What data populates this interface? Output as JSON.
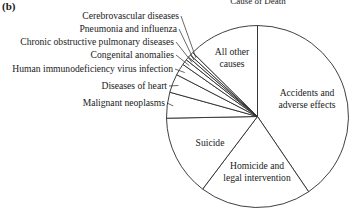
{
  "panel_label": "(b)",
  "chart_data": {
    "type": "pie",
    "title": "Cause of Death",
    "start_angle_deg": 90,
    "direction": "clockwise",
    "slices": [
      {
        "label": "Accidents and adverse effects",
        "lines": [
          "Accidents and",
          "adverse effects"
        ],
        "percent": 40.5,
        "label_inside": true
      },
      {
        "label": "Homicide and legal intervention",
        "lines": [
          "Homicide and",
          "legal intervention"
        ],
        "percent": 19.8,
        "label_inside": true
      },
      {
        "label": "Suicide",
        "lines": [
          "Suicide"
        ],
        "percent": 14.4,
        "label_inside": true
      },
      {
        "label": "Malignant neoplasms",
        "lines": [
          "Malignant neoplasms"
        ],
        "percent": 4.6,
        "label_inside": false
      },
      {
        "label": "Diseases of heart",
        "lines": [
          "Diseases of heart"
        ],
        "percent": 3.3,
        "label_inside": false
      },
      {
        "label": "Human immunodeficiency virus infection",
        "lines": [
          "Human immunodeficiency virus infection"
        ],
        "percent": 2.1,
        "label_inside": false
      },
      {
        "label": "Congenital anomalies",
        "lines": [
          "Congenital anomalies"
        ],
        "percent": 1.0,
        "label_inside": false
      },
      {
        "label": "Chronic obstructive pulmonary diseases",
        "lines": [
          "Chronic obstructive pulmonary diseases"
        ],
        "percent": 0.6,
        "label_inside": false
      },
      {
        "label": "Pneumonia and influenza",
        "lines": [
          "Pneumonia and influenza"
        ],
        "percent": 0.5,
        "label_inside": false
      },
      {
        "label": "Cerebrovascular diseases",
        "lines": [
          "Cerebrovascular diseases"
        ],
        "percent": 0.6,
        "label_inside": false
      },
      {
        "label": "All other causes",
        "lines": [
          "All other",
          "causes"
        ],
        "percent": 12.6,
        "label_inside": true
      }
    ],
    "legend": "none (direct labels with leader lines)",
    "colors": {
      "fill": "#ffffff",
      "stroke": "#2a2a2a",
      "text": "#1a1a1a"
    }
  }
}
